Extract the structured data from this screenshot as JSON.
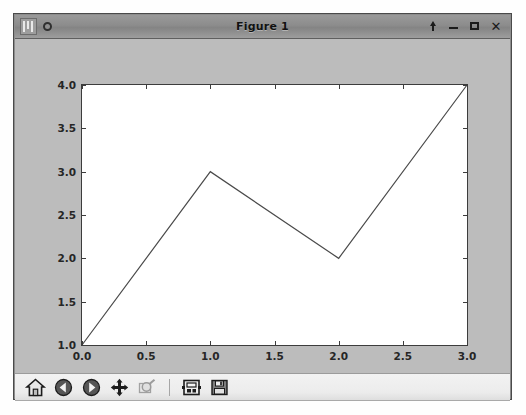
{
  "window": {
    "title": "Figure 1",
    "app_icon": "matplotlib-icon",
    "menu_dot": "menu-dot-icon",
    "controls": [
      {
        "name": "shade-button",
        "label": "⬆",
        "icon": "shade-arrow-icon"
      },
      {
        "name": "minimize-button",
        "label": "–",
        "icon": "minimize-icon"
      },
      {
        "name": "maximize-button",
        "label": "□",
        "icon": "maximize-icon"
      },
      {
        "name": "close-button",
        "label": "✕",
        "icon": "close-icon"
      }
    ],
    "frame_color": "#b8b8b8",
    "titlebar_color": "#8c8c8c"
  },
  "figure": {
    "facecolor": "#bcbcbc",
    "axes_facecolor": "#ffffff",
    "line_color": "#4a4a4a",
    "axis_color": "#3c3c3c"
  },
  "toolbar": {
    "buttons": [
      {
        "name": "home-button",
        "icon": "home-icon",
        "tooltip": "Reset original view",
        "enabled": true
      },
      {
        "name": "back-button",
        "icon": "back-arrow-icon",
        "tooltip": "Back to previous view",
        "enabled": true
      },
      {
        "name": "forward-button",
        "icon": "forward-arrow-icon",
        "tooltip": "Forward to next view",
        "enabled": true
      },
      {
        "name": "pan-button",
        "icon": "pan-move-icon",
        "tooltip": "Pan axes with left mouse, zoom with right",
        "enabled": true
      },
      {
        "name": "zoom-button",
        "icon": "zoom-rect-icon",
        "tooltip": "Zoom to rectangle",
        "enabled": false
      },
      {
        "name": "configure-subplots-button",
        "icon": "subplots-icon",
        "tooltip": "Configure subplots",
        "enabled": true
      },
      {
        "name": "save-button",
        "icon": "save-floppy-icon",
        "tooltip": "Save the figure",
        "enabled": true
      }
    ]
  },
  "chart_data": {
    "type": "line",
    "title": "",
    "xlabel": "",
    "ylabel": "",
    "x": [
      0,
      1,
      2,
      3
    ],
    "y": [
      1,
      3,
      2,
      4
    ],
    "series": [
      {
        "name": "series-1",
        "x": [
          0,
          1,
          2,
          3
        ],
        "values": [
          1,
          3,
          2,
          4
        ]
      }
    ],
    "xlim": [
      0.0,
      3.0
    ],
    "ylim": [
      1.0,
      4.0
    ],
    "xticks": [
      0.0,
      0.5,
      1.0,
      1.5,
      2.0,
      2.5,
      3.0
    ],
    "xtick_labels": [
      "0.0",
      "0.5",
      "1.0",
      "1.5",
      "2.0",
      "2.5",
      "3.0"
    ],
    "yticks": [
      1.0,
      1.5,
      2.0,
      2.5,
      3.0,
      3.5,
      4.0
    ],
    "ytick_labels": [
      "1.0",
      "1.5",
      "2.0",
      "2.5",
      "3.0",
      "3.5",
      "4.0"
    ],
    "grid": false,
    "legend": null,
    "line_width": 1,
    "marker": "none"
  }
}
